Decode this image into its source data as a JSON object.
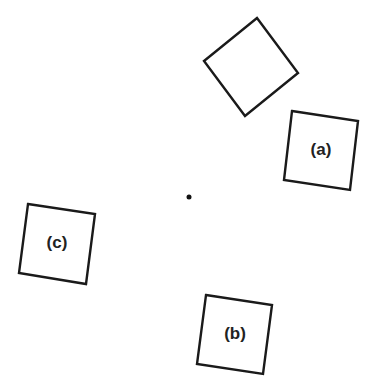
{
  "diagram": {
    "width": 373,
    "height": 392,
    "background": "#ffffff",
    "stroke_color": "#1a1a1a",
    "center_dot": {
      "x": 189,
      "y": 197,
      "r": 2.5
    },
    "shapes": [
      {
        "id": "unlabeled",
        "label": "",
        "points": "257,18 298,73 245,116 204,61",
        "label_x": 251,
        "label_y": 67
      },
      {
        "id": "a",
        "label": "(a)",
        "points": "292,111 358,121 350,190 284,180",
        "label_x": 321,
        "label_y": 151
      },
      {
        "id": "b",
        "label": "(b)",
        "points": "206,295 272,305 263,374 197,364",
        "label_x": 235,
        "label_y": 335
      },
      {
        "id": "c",
        "label": "(c)",
        "points": "28,204 95,214 86,284 19,273",
        "label_x": 57,
        "label_y": 244
      }
    ]
  }
}
